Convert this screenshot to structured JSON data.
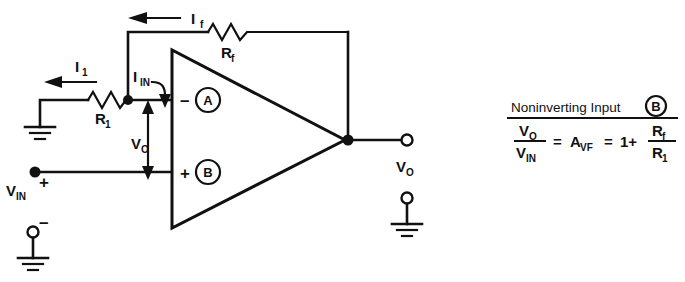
{
  "figure": {
    "kind": "circuit-schematic",
    "ink_color": "#111111",
    "background_color": "#ffffff"
  },
  "circuit": {
    "labels": {
      "current_feedback": "I",
      "current_feedback_sub": "f",
      "current_input_r1": "I",
      "current_input_r1_sub": "1",
      "current_into_node": "I",
      "current_into_node_sub": "IN",
      "resistor_feedback": "R",
      "resistor_feedback_sub": "f",
      "resistor_input": "R",
      "resistor_input_sub": "1",
      "voltage_offset": "V",
      "voltage_offset_sub": "O",
      "voltage_in": "V",
      "voltage_in_sub": "IN",
      "voltage_out": "V",
      "voltage_out_sub": "O",
      "inverting_sign": "–",
      "noninverting_sign": "+",
      "node_a": "A",
      "node_b": "B",
      "source_plus": "+",
      "source_minus": "–"
    },
    "icon_names": {
      "ground": "ground-icon",
      "resistor": "resistor-icon",
      "opamp": "opamp-triangle-icon",
      "arrow": "current-arrow-icon",
      "junction": "junction-dot-icon",
      "terminal": "open-terminal-icon"
    }
  },
  "equation": {
    "heading": "Noninverting Input",
    "heading_circle": "B",
    "numerator_1": "V",
    "numerator_1_sub": "O",
    "denominator_1": "V",
    "denominator_1_sub": "IN",
    "equals_1": "=",
    "gain_symbol": "A",
    "gain_symbol_sub": "VF",
    "equals_2": "=",
    "one_plus": "1+",
    "numerator_2": "R",
    "numerator_2_sub": "f",
    "denominator_2": "R",
    "denominator_2_sub": "1",
    "full_text": "VO / VIN = AVF = 1 + Rf / R1"
  }
}
